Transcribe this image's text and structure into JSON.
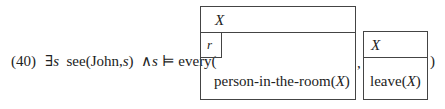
{
  "example": {
    "number": "(40)",
    "formula_prefix": "∃s see(John,s) ∧s ⊨ every(",
    "prefix_parts": {
      "exists": "∃",
      "var_s1": "s",
      "see_open": "see(John,",
      "var_s2": "s",
      "see_close": ")",
      "and": "∧",
      "var_s3": "s",
      "models": "⊨",
      "every_open": "every("
    },
    "restrictor_drs": {
      "universe": "X",
      "subbox_label": "r",
      "condition_pre": "person-in-the-room(",
      "condition_var": "X",
      "condition_post": ")"
    },
    "separator": ",",
    "scope_drs": {
      "universe": "X",
      "condition_pre": "leave(",
      "condition_var": "X",
      "condition_post": ")"
    },
    "closing": ")"
  }
}
